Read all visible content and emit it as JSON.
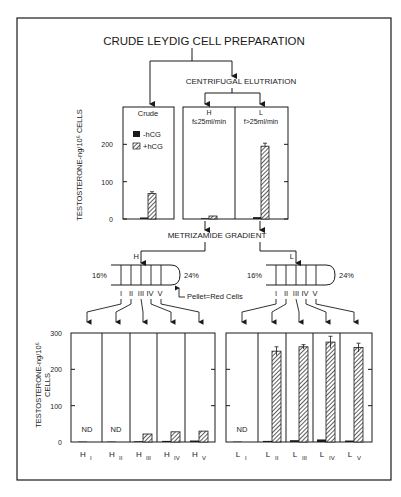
{
  "title": "CRUDE LEYDIG CELL PREPARATION",
  "step1": "CENTRIFUGAL ELUTRIATION",
  "step2": "METRIZAMIDE GRADIENT",
  "legend": {
    "minus": "-hCG",
    "plus": "+hCG"
  },
  "gradient": {
    "low": "16%",
    "high": "24%",
    "fractions": [
      "I",
      "II",
      "III",
      "IV",
      "V"
    ],
    "pellet_note": "Pellet=Red Cells",
    "left_label": "H",
    "right_label": "L"
  },
  "nd_label": "ND",
  "colors": {
    "ink": "#1a1a1a",
    "bg": "#ffffff"
  },
  "chart_data": [
    {
      "type": "bar",
      "title": "Elutriation fractions",
      "ylabel": "TESTOSTERONE-ng/10⁶ CELLS",
      "ylim": [
        0,
        300
      ],
      "yticks": [
        0,
        100,
        200
      ],
      "categories": [
        "Crude",
        "H f≤25ml/min",
        "L f>25ml/min"
      ],
      "series": [
        {
          "name": "-hCG",
          "values": [
            4,
            2,
            5
          ]
        },
        {
          "name": "+hCG",
          "values": [
            68,
            8,
            195
          ]
        }
      ],
      "errors_plus": [
        5,
        0,
        8
      ]
    },
    {
      "type": "bar",
      "title": "H metrizamide fractions",
      "ylabel": "TESTOSTERONE-ng/10⁶ CELLS",
      "ylim": [
        0,
        300
      ],
      "yticks": [
        0,
        100,
        200,
        300
      ],
      "categories": [
        "H I",
        "H II",
        "H III",
        "H IV",
        "H V"
      ],
      "series": [
        {
          "name": "-hCG",
          "values": [
            1,
            1,
            2,
            3,
            4
          ]
        },
        {
          "name": "+hCG",
          "values": [
            0,
            0,
            22,
            28,
            30
          ]
        }
      ],
      "not_detected": [
        true,
        true,
        false,
        false,
        false
      ]
    },
    {
      "type": "bar",
      "title": "L metrizamide fractions",
      "ylabel": "TESTOSTERONE-ng/10⁶ CELLS",
      "ylim": [
        0,
        300
      ],
      "yticks": [
        0,
        100,
        200,
        300
      ],
      "categories": [
        "L I",
        "L II",
        "L III",
        "L IV",
        "L V"
      ],
      "series": [
        {
          "name": "-hCG",
          "values": [
            1,
            3,
            5,
            7,
            4
          ]
        },
        {
          "name": "+hCG",
          "values": [
            0,
            250,
            262,
            275,
            260
          ]
        }
      ],
      "errors_plus": [
        0,
        12,
        6,
        16,
        12
      ],
      "not_detected": [
        true,
        false,
        false,
        false,
        false
      ]
    }
  ],
  "xlabels": {
    "H": [
      [
        "H",
        "I"
      ],
      [
        "H",
        "II"
      ],
      [
        "H",
        "III"
      ],
      [
        "H",
        "IV"
      ],
      [
        "H",
        "V"
      ]
    ],
    "L": [
      [
        "L",
        "I"
      ],
      [
        "L",
        "II"
      ],
      [
        "L",
        "III"
      ],
      [
        "L",
        "IV"
      ],
      [
        "L",
        "V"
      ]
    ]
  }
}
